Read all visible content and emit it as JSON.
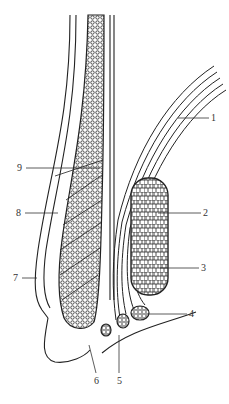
{
  "diagram": {
    "type": "anatomical-cross-section",
    "colors": {
      "ink": "#222222",
      "label": "#333333",
      "background": "#ffffff"
    },
    "labels": [
      {
        "id": "1",
        "text": "1",
        "x": 211,
        "y": 114
      },
      {
        "id": "2",
        "text": "2",
        "x": 203,
        "y": 209
      },
      {
        "id": "3",
        "text": "3",
        "x": 201,
        "y": 263
      },
      {
        "id": "4",
        "text": "4",
        "x": 189,
        "y": 310
      },
      {
        "id": "5",
        "text": "5",
        "x": 117,
        "y": 376
      },
      {
        "id": "6",
        "text": "6",
        "x": 94,
        "y": 376
      },
      {
        "id": "7",
        "text": "7",
        "x": 12,
        "y": 273
      },
      {
        "id": "8",
        "text": "8",
        "x": 16,
        "y": 209
      },
      {
        "id": "9",
        "text": "9",
        "x": 17,
        "y": 163
      }
    ]
  }
}
